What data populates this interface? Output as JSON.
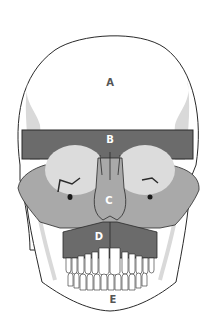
{
  "diagram": {
    "regions": [
      {
        "id": "A",
        "label": "A",
        "area": "cranial vault / frontal",
        "fill": "#ffffff",
        "label_color": "#555555"
      },
      {
        "id": "B",
        "label": "B",
        "area": "brow band",
        "fill": "#6b6b6b",
        "label_color": "#ffffff"
      },
      {
        "id": "C",
        "label": "C",
        "area": "midface",
        "fill": "#a9a9a9",
        "label_color": "#ffffff"
      },
      {
        "id": "D",
        "label": "D",
        "area": "maxilla",
        "fill": "#6b6b6b",
        "label_color": "#ffffff"
      },
      {
        "id": "E",
        "label": "E",
        "area": "mandible",
        "fill": "#ffffff",
        "label_color": "#555555"
      }
    ],
    "colors": {
      "outline": "#2a2a2a",
      "dark_region": "#6b6b6b",
      "mid_region": "#a9a9a9",
      "light_shade": "#d9d9d9",
      "orbit": "#dcdcdc"
    }
  }
}
